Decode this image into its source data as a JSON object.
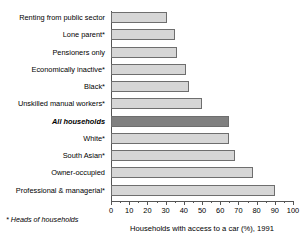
{
  "chart_data": {
    "type": "bar",
    "orientation": "horizontal",
    "title": "",
    "xlabel": "Households with access to a car (%), 1991",
    "ylabel": "",
    "xlim": [
      0,
      100
    ],
    "grid": false,
    "legend": null,
    "footnote": "* Heads of households",
    "xticks": [
      0,
      10,
      20,
      30,
      40,
      50,
      60,
      70,
      80,
      90,
      100
    ],
    "xticklabels": [
      "0",
      "10",
      "20",
      "30",
      "40",
      "50",
      "60",
      "70",
      "80",
      "90",
      "100"
    ],
    "categories": [
      "Renting from public sector",
      "Lone parent*",
      "Pensioners only",
      "Economically inactive*",
      "Black*",
      "Unskilled manual workers*",
      "All households",
      "White*",
      "South Asian*",
      "Owner-occupied",
      "Professional & managerial*"
    ],
    "values": [
      31,
      35,
      36,
      41,
      43,
      50,
      65,
      65,
      68,
      78,
      90
    ],
    "bars": [
      {
        "label": "Renting from public sector",
        "value": 31,
        "highlight": false,
        "emphasis": false
      },
      {
        "label": "Lone parent*",
        "value": 35,
        "highlight": false,
        "emphasis": false
      },
      {
        "label": "Pensioners only",
        "value": 36,
        "highlight": false,
        "emphasis": false
      },
      {
        "label": "Economically inactive*",
        "value": 41,
        "highlight": false,
        "emphasis": false
      },
      {
        "label": "Black*",
        "value": 43,
        "highlight": false,
        "emphasis": false
      },
      {
        "label": "Unskilled manual workers*",
        "value": 50,
        "highlight": false,
        "emphasis": false
      },
      {
        "label": "All households",
        "value": 65,
        "highlight": true,
        "emphasis": true
      },
      {
        "label": "White*",
        "value": 65,
        "highlight": false,
        "emphasis": false
      },
      {
        "label": "South Asian*",
        "value": 68,
        "highlight": false,
        "emphasis": false
      },
      {
        "label": "Owner-occupied",
        "value": 78,
        "highlight": false,
        "emphasis": false
      },
      {
        "label": "Professional & managerial*",
        "value": 90,
        "highlight": false,
        "emphasis": false
      }
    ],
    "colors": {
      "bar_fill": "#d6d6d6",
      "bar_highlight_fill": "#808080",
      "bar_stroke": "#6e6e6e",
      "axis": "#555555",
      "text": "#000000",
      "background": "#ffffff"
    }
  }
}
